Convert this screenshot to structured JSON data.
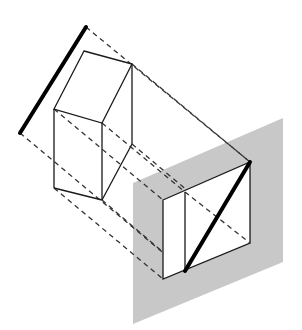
{
  "diagram": {
    "title": "",
    "colors": {
      "background": "#ffffff",
      "plane_fill": "#c8c8c8",
      "face_fill": "#ffffff",
      "line": "#1a1a1a",
      "dashed": "#333333"
    },
    "edge_view_line": {
      "x1": 86,
      "y1": 27,
      "x2": 20,
      "y2": 133
    },
    "box": {
      "top_face": [
        [
          84,
          51
        ],
        [
          132,
          64
        ],
        [
          102,
          123
        ],
        [
          54,
          109
        ]
      ],
      "verticals": [
        [
          [
            54,
            109
          ],
          [
            54,
            188
          ]
        ],
        [
          [
            102,
            123
          ],
          [
            102,
            200
          ]
        ],
        [
          [
            132,
            64
          ],
          [
            132,
            144
          ]
        ]
      ],
      "bottom_edges": [
        [
          [
            54,
            188
          ],
          [
            102,
            200
          ]
        ],
        [
          [
            102,
            200
          ],
          [
            132,
            144
          ]
        ]
      ]
    },
    "projection_plane": [
      [
        133,
        183
      ],
      [
        283,
        118
      ],
      [
        283,
        262
      ],
      [
        133,
        324
      ]
    ],
    "projected_face": {
      "outer": [
        [
          163,
          200
        ],
        [
          250,
          162
        ],
        [
          250,
          243
        ],
        [
          163,
          279
        ]
      ],
      "inner_divider": [
        [
          185,
          192
        ],
        [
          185,
          271
        ]
      ],
      "bold_diagonal": [
        [
          250,
          162
        ],
        [
          185,
          271
        ]
      ],
      "hidden_diagonal": [
        [
          185,
          192
        ],
        [
          250,
          243
        ]
      ]
    },
    "projectors": [
      [
        [
          86,
          27
        ],
        [
          250,
          162
        ]
      ],
      [
        [
          20,
          133
        ],
        [
          185,
          271
        ]
      ],
      [
        [
          132,
          64
        ],
        [
          250,
          162
        ]
      ],
      [
        [
          54,
          109
        ],
        [
          163,
          200
        ]
      ],
      [
        [
          102,
          123
        ],
        [
          185,
          192
        ]
      ],
      [
        [
          54,
          188
        ],
        [
          163,
          279
        ]
      ],
      [
        [
          102,
          200
        ],
        [
          185,
          271
        ]
      ],
      [
        [
          132,
          144
        ],
        [
          250,
          243
        ]
      ]
    ]
  }
}
